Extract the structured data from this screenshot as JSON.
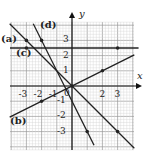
{
  "chart_data": {
    "type": "line",
    "title": "",
    "xlabel": "x",
    "ylabel": "y",
    "xlim": [
      -4,
      4
    ],
    "ylim": [
      -4,
      4
    ],
    "grid": true,
    "x_ticks": [
      "-3",
      "-2",
      "-1",
      "2",
      "3"
    ],
    "y_ticks": [
      "3",
      "2",
      "1",
      "-1",
      "-2",
      "-3"
    ],
    "origin_label": "0",
    "series": [
      {
        "name": "(a)",
        "equation": "y = -x",
        "points": [
          [
            -3,
            3
          ],
          [
            3,
            -3
          ]
        ]
      },
      {
        "name": "(b)",
        "equation": "y = x/2",
        "points": [
          [
            -2,
            -1
          ],
          [
            0,
            0
          ],
          [
            2,
            1
          ]
        ]
      },
      {
        "name": "(c)",
        "equation": "y = 2.5",
        "points": [
          [
            -3,
            2.5
          ],
          [
            3,
            2.5
          ]
        ]
      },
      {
        "name": "(d)",
        "equation": "y = -2x - 1",
        "points": [
          [
            -2,
            3
          ],
          [
            1,
            -3
          ]
        ]
      }
    ],
    "colors": {
      "line": "#222222",
      "grid": "#bbbbbb",
      "axis": "#111111"
    }
  },
  "labels": {
    "a": "(a)",
    "b": "(b)",
    "c": "(c)",
    "d": "(d)",
    "x": "x",
    "y": "y"
  }
}
